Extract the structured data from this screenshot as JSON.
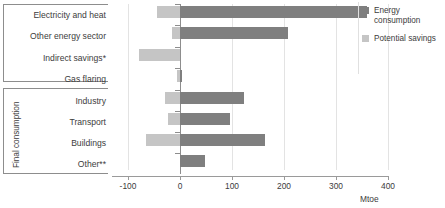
{
  "chart_data": {
    "type": "bar",
    "orientation": "horizontal",
    "title": "",
    "xlabel": "Mtoe",
    "ylabel": "",
    "xlim": [
      -130,
      400
    ],
    "xticks": [
      -100,
      0,
      100,
      200,
      300,
      400
    ],
    "xtick_labels": [
      "-100",
      "0",
      "100",
      "200",
      "300",
      "400"
    ],
    "grid": true,
    "legend_position": "right",
    "categories": [
      "Electricity and heat",
      "Other energy sector",
      "Indirect savings*",
      "Gas flaring",
      "Industry",
      "Transport",
      "Buildings",
      "Other**"
    ],
    "series": [
      {
        "name": "Energy consumption",
        "color": "#7f7f7f",
        "values": [
          359,
          208,
          0,
          4,
          123,
          96,
          164,
          48
        ]
      },
      {
        "name": "Potential savings",
        "color": "#c5c5c5",
        "values": [
          -44,
          -15,
          -78,
          -5,
          -28,
          -22,
          -64,
          0
        ]
      }
    ],
    "groups": [
      {
        "label": "",
        "categories": [
          "Electricity and heat",
          "Other energy sector",
          "Indirect savings*",
          "Gas flaring"
        ]
      },
      {
        "label": "Final consumption",
        "categories": [
          "Industry",
          "Transport",
          "Buildings",
          "Other**"
        ]
      }
    ]
  },
  "axis": {
    "unit": "Mtoe",
    "ticks": [
      {
        "value": -100,
        "label": "-100"
      },
      {
        "value": 0,
        "label": "0"
      },
      {
        "value": 100,
        "label": "100"
      },
      {
        "value": 200,
        "label": "200"
      },
      {
        "value": 300,
        "label": "300"
      },
      {
        "value": 400,
        "label": "400"
      }
    ]
  },
  "groups": {
    "supply_label": "",
    "final_label": "Final consumption"
  },
  "categories": [
    {
      "label": "Electricity and heat"
    },
    {
      "label": "Other energy sector"
    },
    {
      "label": "Indirect savings*"
    },
    {
      "label": "Gas flaring"
    },
    {
      "label": "Industry"
    },
    {
      "label": "Transport"
    },
    {
      "label": "Buildings"
    },
    {
      "label": "Other**"
    }
  ],
  "legend": {
    "items": [
      {
        "label": "Energy consumption",
        "color": "#7f7f7f"
      },
      {
        "label": "Potential savings",
        "color": "#c5c5c5"
      }
    ]
  }
}
